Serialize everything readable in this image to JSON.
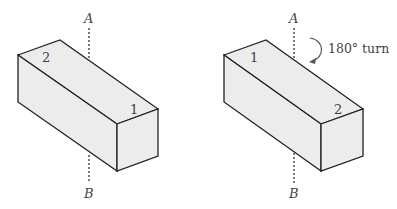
{
  "figures": [
    {
      "id": "before",
      "axis_top_label": "A",
      "axis_bottom_label": "B",
      "top_face_label_back": "2",
      "top_face_label_front": "1"
    },
    {
      "id": "after",
      "axis_top_label": "A",
      "axis_bottom_label": "B",
      "top_face_label_back": "1",
      "top_face_label_front": "2",
      "rotation_label": "180° turn"
    }
  ],
  "colors": {
    "face_fill": "#ececec",
    "edge": "#222222",
    "text": "#444444"
  }
}
